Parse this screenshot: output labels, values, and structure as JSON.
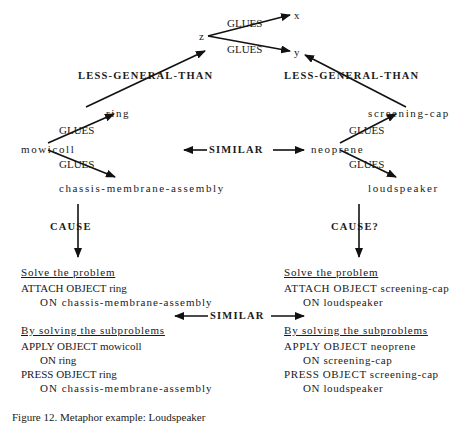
{
  "nodes": {
    "z": "z",
    "x": "x",
    "y": "y",
    "ring": "ring",
    "mowicoll": "mowicoll",
    "chassis": "chassis-membrane-assembly",
    "screening_cap": "screening-cap",
    "neoprene": "neoprene",
    "loudspeaker": "loudspeaker"
  },
  "relations": {
    "glues": "GLUES",
    "less_general_than": "LESS-GENERAL-THAN",
    "similar": "SIMILAR",
    "cause": "CAUSE",
    "cause_q": "CAUSE?"
  },
  "left_plan": {
    "problem_heading": "Solve the problem",
    "problem_line1": "ATTACH OBJECT ring",
    "problem_line2": "ON chassis-membrane-assembly",
    "subproblems_heading": "By solving the subproblems",
    "steps": [
      "APPLY OBJECT mowicoll",
      "ON ring",
      "PRESS OBJECT ring",
      "ON chassis-membrane-assembly"
    ]
  },
  "right_plan": {
    "problem_heading": "Solve the problem",
    "problem_line1": "ATTACH OBJECT screening-cap",
    "problem_line2": "ON loudspeaker",
    "subproblems_heading": "By solving the subproblems",
    "steps": [
      "APPLY OBJECT neoprene",
      "ON screening-cap",
      "PRESS OBJECT screening-cap",
      "ON loudspeaker"
    ]
  },
  "caption": "Figure 12. Metaphor example: Loudspeaker"
}
